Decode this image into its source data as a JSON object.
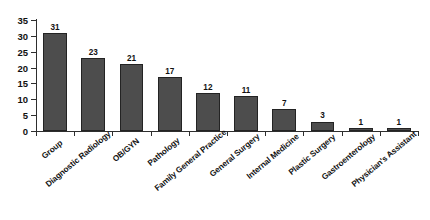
{
  "chart_data": {
    "type": "bar",
    "title": "",
    "subtitle": "",
    "xlabel": "",
    "ylabel": "",
    "ylim": [
      0,
      35
    ],
    "ytick_step": 5,
    "yticks": [
      0,
      5,
      10,
      15,
      20,
      25,
      30,
      35
    ],
    "grid": true,
    "legend": false,
    "legend_position": "none",
    "orientation": "vertical",
    "bar_color": "#4d4d4d",
    "bar_edge_color": "#232323",
    "gridline_color": "#3a3a3a",
    "axis_color": "#2e2e2e",
    "background": "#ffffff",
    "data_labels": true,
    "categories": [
      "Group",
      "Diagnostic Radiology",
      "OB/GYN",
      "Pathology",
      "Family General Practice",
      "General Surgery",
      "Internal Medicine",
      "Plastic Surgery",
      "Gastroenterology",
      "Physician's Assistant"
    ],
    "values": [
      31,
      23,
      21,
      17,
      12,
      11,
      7,
      3,
      1,
      1
    ]
  }
}
